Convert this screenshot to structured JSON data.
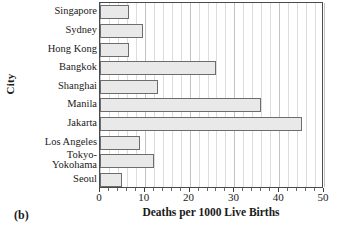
{
  "figure": {
    "panel_label": "(b)"
  },
  "chart_data": {
    "type": "bar",
    "orientation": "horizontal",
    "title": "",
    "xlabel": "Deaths per 1000 Live Births",
    "ylabel": "City",
    "categories": [
      "Singapore",
      "Sydney",
      "Hong Kong",
      "Bangkok",
      "Shanghai",
      "Manila",
      "Jakarta",
      "Los Angeles",
      "Tokyo-Yokohama",
      "Seoul"
    ],
    "category_order": [
      "Singapore",
      "Sydney",
      "Hong Kong",
      "Bangkok",
      "Shanghai",
      "Manila",
      "Jakarta",
      "Los Angeles",
      "Seoul",
      "Tokyo-Yokohama"
    ],
    "values": [
      6.5,
      9.5,
      6.5,
      26.0,
      13.0,
      36.0,
      45.0,
      9.0,
      12.0,
      5.0
    ],
    "xlim": [
      0,
      50
    ],
    "xticks": [
      0,
      10,
      20,
      30,
      40,
      50
    ],
    "xtick_labels": [
      "0",
      "10",
      "20",
      "30",
      "40",
      "50"
    ],
    "minor_tick_step": 2,
    "grid": "vertical",
    "legend": "none",
    "bar_fill_color": "#e9e9e9",
    "bar_edge_color": "#6d6d6d",
    "gridline_color": "#dcdcdc",
    "axis_color": "#4a4a4a"
  },
  "labels": {
    "tokyo_line1": "Tokyo-",
    "tokyo_line2": "Yokohama"
  }
}
